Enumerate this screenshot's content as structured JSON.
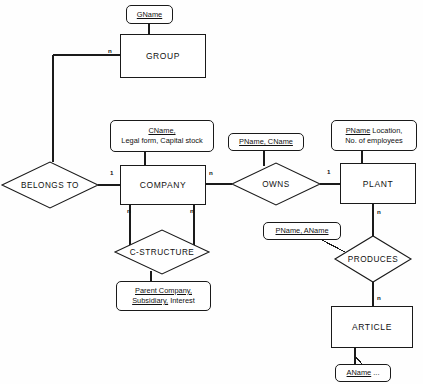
{
  "diagram": {
    "entities": [
      {
        "id": "group",
        "label": "GROUP",
        "x": 120,
        "y": 34,
        "w": 86,
        "h": 44
      },
      {
        "id": "company",
        "label": "COMPANY",
        "x": 120,
        "y": 165,
        "w": 86,
        "h": 40
      },
      {
        "id": "plant",
        "label": "PLANT",
        "x": 340,
        "y": 163,
        "w": 76,
        "h": 41
      },
      {
        "id": "article",
        "label": "ARTICLE",
        "x": 331,
        "y": 306,
        "w": 82,
        "h": 42
      }
    ],
    "relationships": [
      {
        "id": "belongs-to",
        "label": "BELONGS TO",
        "cx": 50,
        "cy": 185,
        "rx": 48,
        "ry": 23
      },
      {
        "id": "owns",
        "label": "OWNS",
        "cx": 276,
        "cy": 184,
        "rx": 44,
        "ry": 21
      },
      {
        "id": "c-structure",
        "label": "C-STRUCTURE",
        "cx": 162,
        "cy": 252,
        "rx": 47,
        "ry": 22
      },
      {
        "id": "produces",
        "label": "PRODUCES",
        "cx": 373,
        "cy": 259,
        "rx": 38,
        "ry": 23
      }
    ],
    "attributes": [
      {
        "id": "gname",
        "key": "GName",
        "rest": "",
        "line2_key": "",
        "line2_rest": "",
        "x": 126,
        "y": 5,
        "w": 47,
        "h": 19
      },
      {
        "id": "cname",
        "key": "CName,",
        "rest": "",
        "line2_key": "",
        "line2_rest": "Legal form, Capital stock",
        "x": 110,
        "y": 120,
        "w": 104,
        "h": 32
      },
      {
        "id": "pname-cname",
        "key": "PName, CName",
        "rest": "",
        "line2_key": "",
        "line2_rest": "",
        "x": 228,
        "y": 133,
        "w": 76,
        "h": 18
      },
      {
        "id": "pname-location",
        "key": "PName",
        "rest": " Location,",
        "line2_key": "",
        "line2_rest": "No. of employees",
        "x": 331,
        "y": 120,
        "w": 86,
        "h": 31
      },
      {
        "id": "pname-aname",
        "key": "PName, AName",
        "rest": "",
        "line2_key": "",
        "line2_rest": "",
        "x": 263,
        "y": 222,
        "w": 78,
        "h": 18
      },
      {
        "id": "parent-company",
        "key": "Parent Company,",
        "rest": "",
        "line2_key": "Subsidiary,",
        "line2_rest": " Interest",
        "x": 116,
        "y": 281,
        "w": 95,
        "h": 30
      },
      {
        "id": "aname",
        "key": "AName",
        "rest": " ...",
        "line2_key": "",
        "line2_rest": "",
        "x": 335,
        "y": 364,
        "w": 56,
        "h": 18
      }
    ],
    "cardinalities": [
      {
        "id": "card-group-n",
        "value": "n",
        "x": 108,
        "y": 47
      },
      {
        "id": "card-company-1",
        "value": "1",
        "x": 110,
        "y": 169
      },
      {
        "id": "card-company-n",
        "value": "n",
        "x": 209,
        "y": 169
      },
      {
        "id": "card-company-n-left",
        "value": "n",
        "x": 127,
        "y": 207
      },
      {
        "id": "card-company-n-right",
        "value": "n",
        "x": 190,
        "y": 207
      },
      {
        "id": "card-plant-1",
        "value": "1",
        "x": 327,
        "y": 168
      },
      {
        "id": "card-plant-n",
        "value": "n",
        "x": 377,
        "y": 208
      },
      {
        "id": "card-article-n",
        "value": "n",
        "x": 377,
        "y": 294
      }
    ],
    "colors": {
      "stroke": "#1a1a1a",
      "fill": "#ffffff",
      "background": "#fefefe",
      "text": "#111111"
    }
  }
}
